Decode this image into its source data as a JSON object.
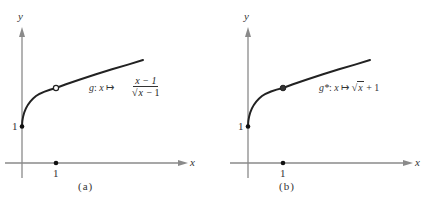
{
  "figure": {
    "panels": [
      {
        "id": "a",
        "caption": "(a)",
        "axis_labels": {
          "x": "x",
          "y": "y"
        },
        "ticks": {
          "x_one": "1",
          "y_one": "1"
        },
        "function_label": {
          "name": "g",
          "separator": ":",
          "var": "x",
          "arrow": "↦",
          "numerator": "x − 1",
          "denominator_radicand": "x",
          "denominator_rest": " − 1"
        },
        "special_point": {
          "x": 1,
          "y": 2,
          "style": "open-circle",
          "meaning": "excluded (hole)"
        }
      },
      {
        "id": "b",
        "caption": "(b)",
        "axis_labels": {
          "x": "x",
          "y": "y"
        },
        "ticks": {
          "x_one": "1",
          "y_one": "1"
        },
        "function_label": {
          "name": "g*",
          "separator": ":",
          "var": "x",
          "arrow": "↦",
          "radicand": "x",
          "rest": " + 1"
        },
        "special_point": {
          "x": 1,
          "y": 2,
          "style": "filled-circle",
          "meaning": "included"
        }
      }
    ],
    "colors": {
      "curve": "#222222",
      "axis": "#888888",
      "text": "#333333"
    }
  }
}
